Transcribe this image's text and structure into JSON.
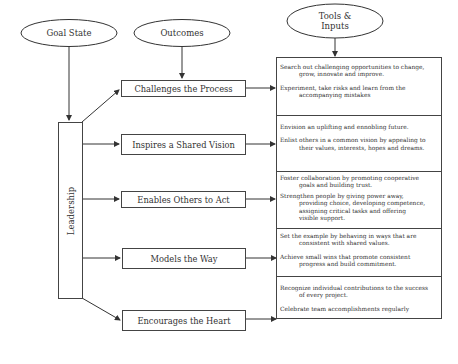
{
  "header": {
    "goal_state": "Goal State",
    "outcomes": "Outcomes",
    "tools_inputs_line1": "Tools &",
    "tools_inputs_line2": "Inputs"
  },
  "center": {
    "label": "Leadership"
  },
  "practices": [
    {
      "label": "Challenges the Process",
      "tools": [
        {
          "first": "Search out challenging opportunities to change,",
          "rest": [
            "grow, innovate and improve."
          ]
        },
        {
          "first": "Experiment, take risks and learn from the",
          "rest": [
            "accompanying mistakes"
          ]
        }
      ]
    },
    {
      "label": "Inspires a Shared Vision",
      "tools": [
        {
          "first": "Envision an uplifting and ennobling future.",
          "rest": []
        },
        {
          "first": "Enlist others in a common vision by appealing to",
          "rest": [
            "their values, interests, hopes and dreams."
          ]
        }
      ]
    },
    {
      "label": "Enables Others to Act",
      "tools": [
        {
          "first": "Foster collaboration by promoting cooperative",
          "rest": [
            "goals and building trust."
          ]
        },
        {
          "first": "Strengthen people by giving power away,",
          "rest": [
            "providing choice, developing competence,",
            "assigning critical tasks and offering",
            "visible support."
          ]
        }
      ]
    },
    {
      "label": "Models the Way",
      "tools": [
        {
          "first": "Set the example by behaving in ways that are",
          "rest": [
            "consistent with shared values."
          ]
        },
        {
          "first": "Achieve small wins that promote consistent",
          "rest": [
            "progress and build commitment."
          ]
        }
      ]
    },
    {
      "label": "Encourages the Heart",
      "tools": [
        {
          "first": "Recognize individual contributions to the success",
          "rest": [
            "of every project."
          ]
        },
        {
          "first": "Celebrate team accomplishments regularly",
          "rest": []
        }
      ]
    }
  ],
  "colors": {
    "line": "#333333",
    "text": "#333333",
    "background": "#ffffff"
  }
}
